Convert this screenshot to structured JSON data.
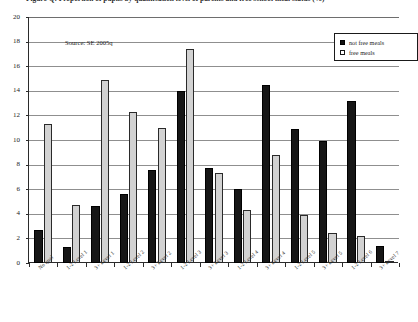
{
  "chart_data": {
    "type": "bar",
    "title": "Figure Q: Proportion of pupils by qualification level of parents and free school meal status (%)",
    "xlabel": "",
    "ylabel": "",
    "ylim": [
      0,
      20
    ],
    "ytick_step": 2,
    "yticks": [
      "0",
      "2",
      "4",
      "6",
      "8",
      "10",
      "12",
      "14",
      "16",
      "18",
      "20"
    ],
    "grid": true,
    "legend_position": "top-right",
    "source_note": "Source: SE 2005q",
    "categories": [
      "No qual",
      "1-2 Level 1",
      "3+ Level 1",
      "1-2 Level 2",
      "3+ Level 2",
      "1-2 Level 3",
      "3+ Level 3",
      "1-2 Level 4",
      "3+ Level 4",
      "1-2 Level 5",
      "3+ Level 5",
      "1-2 Level 6",
      "3+ Level 7"
    ],
    "series": [
      {
        "name": "not free meals",
        "color": "#161616",
        "values": [
          2.7,
          1.3,
          4.6,
          5.6,
          7.6,
          14.0,
          7.7,
          6.0,
          14.5,
          10.9,
          9.9,
          13.2,
          1.4
        ]
      },
      {
        "name": "free meals",
        "color": "#d2d2d2",
        "values": [
          11.3,
          4.7,
          14.9,
          12.3,
          11.0,
          17.4,
          7.3,
          4.3,
          8.8,
          3.9,
          2.4,
          2.2,
          0.2
        ]
      }
    ]
  },
  "legend": {
    "items": [
      {
        "label": "not free meals",
        "swatch": "filled-square"
      },
      {
        "label": "free meals",
        "swatch": "hollow-square"
      }
    ]
  }
}
